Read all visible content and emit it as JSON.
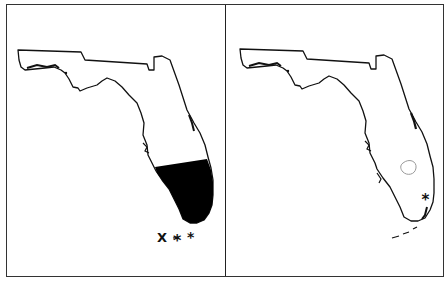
{
  "figure": {
    "panels": [
      {
        "id": "left",
        "subject": "Florida state outline",
        "shaded_region": "southern Florida (black fill)",
        "markers": [
          "X",
          "*",
          "*"
        ]
      },
      {
        "id": "right",
        "subject": "Florida state outline",
        "shaded_region": "none",
        "markers": [
          "*"
        ],
        "features": [
          "Lake Okeechobee outline (gray)"
        ]
      }
    ],
    "colors": {
      "outline": "#111111",
      "fill": "#000000",
      "lake": "#999999",
      "background": "#ffffff"
    }
  },
  "labels": {
    "left_marker_x": "X",
    "left_marker_star1": "*",
    "left_marker_star2": "*",
    "right_marker_star": "*"
  }
}
